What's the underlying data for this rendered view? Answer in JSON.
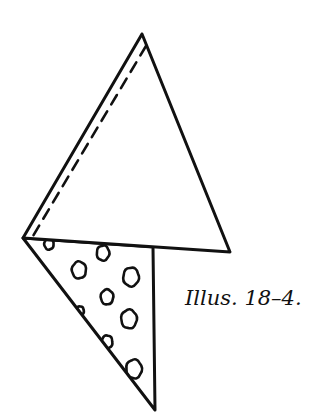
{
  "caption": "Illus. 18–4.",
  "colors": {
    "ink": "#111111",
    "background": "#ffffff"
  },
  "figure": {
    "upper_triangle": {
      "apex": [
        142,
        34
      ],
      "left": [
        23,
        238
      ],
      "right": [
        230,
        252
      ]
    },
    "lower_triangle": {
      "left": [
        23,
        238
      ],
      "top_right": [
        153,
        247
      ],
      "bottom": [
        155,
        410
      ]
    },
    "fold_line": {
      "style": "dashed",
      "from": [
        146,
        46
      ],
      "to": [
        33,
        236
      ]
    },
    "pattern_blobs": [
      {
        "cx": 49,
        "cy": 244,
        "r": 6
      },
      {
        "cx": 103,
        "cy": 253,
        "r": 8
      },
      {
        "cx": 79,
        "cy": 270,
        "r": 9
      },
      {
        "cx": 131,
        "cy": 277,
        "r": 10
      },
      {
        "cx": 107,
        "cy": 297,
        "r": 8
      },
      {
        "cx": 80,
        "cy": 311,
        "r": 5
      },
      {
        "cx": 129,
        "cy": 319,
        "r": 10
      },
      {
        "cx": 107,
        "cy": 342,
        "r": 7
      },
      {
        "cx": 134,
        "cy": 369,
        "r": 10
      }
    ]
  }
}
